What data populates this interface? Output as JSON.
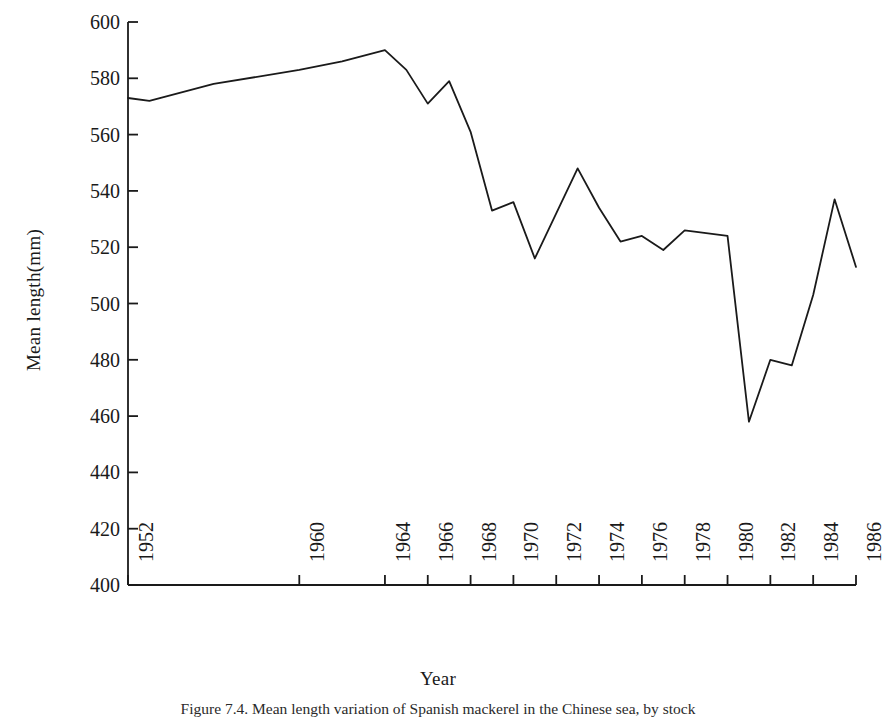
{
  "figure": {
    "caption": "Figure 7.4.  Mean length variation of Spanish mackerel in the Chinese sea, by stock",
    "background_color": "#ffffff",
    "line_color": "#1a1a1a",
    "axis_color": "#1a1a1a"
  },
  "chart_data": {
    "type": "line",
    "title": "",
    "subtitle": "",
    "xlabel": "Year",
    "ylabel": "Mean length(mm)",
    "xlim": [
      1952,
      1986
    ],
    "ylim": [
      400,
      600
    ],
    "grid": false,
    "legend": null,
    "legend_position": "none",
    "y_ticks": [
      400,
      420,
      440,
      460,
      480,
      500,
      520,
      540,
      560,
      580,
      600
    ],
    "y_tick_labels": [
      "400",
      "420",
      "440",
      "460",
      "480",
      "500",
      "520",
      "540",
      "560",
      "580",
      "600"
    ],
    "x_ticks": [
      1952,
      1960,
      1964,
      1966,
      1968,
      1970,
      1972,
      1974,
      1976,
      1978,
      1980,
      1982,
      1984,
      1986
    ],
    "x_tick_labels": [
      "1952",
      "1960",
      "1964",
      "1966",
      "1968",
      "1970",
      "1972",
      "1974",
      "1976",
      "1978",
      "1980",
      "1982",
      "1984",
      "1986"
    ],
    "x_tick_rotation": 90,
    "series": [
      {
        "name": "Mean length",
        "color": "#1a1a1a",
        "x": [
          1952,
          1953,
          1956,
          1960,
          1962,
          1964,
          1965,
          1966,
          1967,
          1968,
          1969,
          1970,
          1971,
          1972,
          1973,
          1974,
          1975,
          1976,
          1977,
          1978,
          1979,
          1980,
          1981,
          1982,
          1983,
          1984,
          1985,
          1986
        ],
        "values": [
          573,
          572,
          578,
          583,
          586,
          590,
          583,
          571,
          579,
          561,
          533,
          536,
          516,
          532,
          548,
          534,
          522,
          524,
          519,
          526,
          525,
          524,
          458,
          480,
          478,
          503,
          537,
          513
        ]
      }
    ],
    "annotations": []
  },
  "axis_titles": {
    "x": "Year",
    "y": "Mean length(mm)"
  }
}
